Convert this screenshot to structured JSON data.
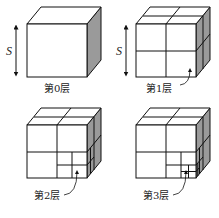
{
  "figure": {
    "size_label": "S",
    "panels": [
      {
        "label": "第0层",
        "level": 0
      },
      {
        "label": "第1层",
        "level": 1
      },
      {
        "label": "第2层",
        "level": 2
      },
      {
        "label": "第3层",
        "level": 3
      }
    ],
    "colors": {
      "line": "#111111",
      "shade": "#9a9a9a",
      "background": "#ffffff"
    }
  }
}
